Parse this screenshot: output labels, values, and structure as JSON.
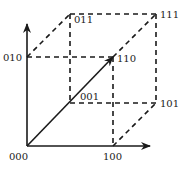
{
  "diagram": {
    "type": "unit-cube-vector-space",
    "vertices": [
      {
        "label": "000",
        "x": 27,
        "y": 146,
        "lx": 9,
        "ly": 160
      },
      {
        "label": "100",
        "x": 113,
        "y": 146,
        "lx": 103,
        "ly": 160
      },
      {
        "label": "010",
        "x": 27,
        "y": 57,
        "lx": 3,
        "ly": 61
      },
      {
        "label": "110",
        "x": 113,
        "y": 57,
        "lx": 117,
        "ly": 62
      },
      {
        "label": "001",
        "x": 70,
        "y": 103,
        "lx": 80,
        "ly": 100
      },
      {
        "label": "101",
        "x": 156,
        "y": 103,
        "lx": 160,
        "ly": 107
      },
      {
        "label": "011",
        "x": 70,
        "y": 14,
        "lx": 74,
        "ly": 23
      },
      {
        "label": "111",
        "x": 156,
        "y": 14,
        "lx": 160,
        "ly": 18
      }
    ],
    "axes": [
      {
        "name": "x-axis",
        "from": [
          27,
          146
        ],
        "to": [
          150,
          146
        ]
      },
      {
        "name": "y-axis",
        "from": [
          27,
          146
        ],
        "to": [
          27,
          24
        ]
      }
    ],
    "vector": {
      "name": "vector-000-to-110",
      "from": [
        27,
        146
      ],
      "to": [
        113,
        57
      ]
    },
    "dashed_edges": [
      {
        "from": "010",
        "to": "110"
      },
      {
        "from": "010",
        "to": "011"
      },
      {
        "from": "011",
        "to": "111"
      },
      {
        "from": "011",
        "to": "001"
      },
      {
        "from": "110",
        "to": "111"
      },
      {
        "from": "110",
        "to": "100"
      },
      {
        "from": "111",
        "to": "101"
      },
      {
        "from": "001",
        "to": "101"
      },
      {
        "from": "100",
        "to": "101"
      }
    ],
    "colors": {
      "line": "#1a1a1a",
      "background": "#ffffff"
    }
  }
}
